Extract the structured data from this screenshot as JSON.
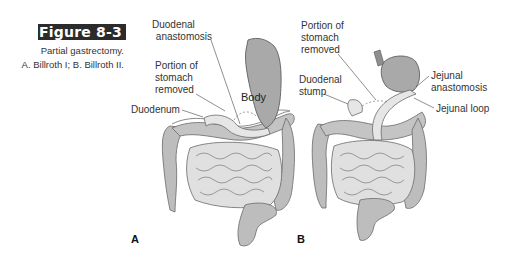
{
  "figure": {
    "number": "Figure 8-3",
    "caption_line1": "Partial gastrectomy.",
    "caption_line2": "A. Billroth I; B. Billroth II.",
    "banner_color": "#2b2b2b"
  },
  "panel_a": {
    "letter": "A",
    "labels": {
      "duodenal_anastomosis_1": "Duodenal",
      "duodenal_anastomosis_2": "anastomosis",
      "portion_1": "Portion of",
      "portion_2": "stomach",
      "portion_3": "removed",
      "duodenum": "Duodenum",
      "body": "Body"
    }
  },
  "panel_b": {
    "letter": "B",
    "labels": {
      "portion_1": "Portion of",
      "portion_2": "stomach",
      "portion_3": "removed",
      "duodenal_stump_1": "Duodenal",
      "duodenal_stump_2": "stump",
      "jejunal_anastomosis_1": "Jejunal",
      "jejunal_anastomosis_2": "anastomosis",
      "jejunal_loop": "Jejunal loop"
    }
  },
  "colors": {
    "organ_fill": "#bdbdbd",
    "organ_light": "#d9d9d9",
    "stomach_fill": "#a9a9a9",
    "outline": "#6a6a6a"
  }
}
